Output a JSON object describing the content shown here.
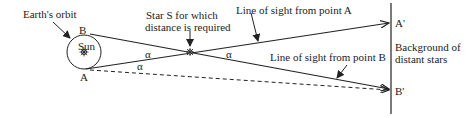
{
  "diagram": {
    "labels": {
      "earth_orbit": "Earth's orbit",
      "sun": "Sun",
      "point_b": "B",
      "point_a": "A",
      "star_line1": "Star S for which",
      "star_line2": "distance is required",
      "sight_a": "Line of sight from point A",
      "sight_b": "Line of sight from point B",
      "a_prime": "A'",
      "b_prime": "B'",
      "background_line1": "Background of",
      "background_line2": "distant stars",
      "alpha": "α"
    },
    "colors": {
      "stroke": "#222222",
      "background": "#ffffff"
    }
  }
}
